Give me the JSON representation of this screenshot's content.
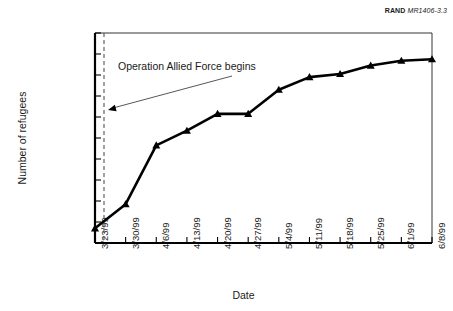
{
  "credit": {
    "brand": "RAND",
    "document": "MR1406-3.3"
  },
  "chart_data": {
    "type": "line",
    "title": "",
    "xlabel": "Date",
    "ylabel": "Number of refugees",
    "categories": [
      "3/23/99",
      "3/30/99",
      "4/6/99",
      "4/13/99",
      "4/20/99",
      "4/27/99",
      "5/4/99",
      "5/11/99",
      "5/18/99",
      "5/25/99",
      "6/1/99",
      "6/8/99"
    ],
    "values": [
      70000,
      185000,
      465000,
      535000,
      615000,
      615000,
      730000,
      790000,
      805000,
      845000,
      868000,
      875000
    ],
    "ylim": [
      0,
      1000000
    ],
    "ytick_values": [
      0,
      100000,
      200000,
      300000,
      400000,
      500000,
      600000,
      700000,
      800000,
      900000,
      1000000
    ],
    "ytick_labels": [
      "0",
      "100,000",
      "200,000",
      "300,000",
      "400,000",
      "500,000",
      "600,000",
      "700,000",
      "800,000",
      "900,000",
      "1,000,000"
    ],
    "grid": false,
    "legend": false,
    "marker": "triangle",
    "line_color": "#000000",
    "annotations": [
      {
        "text": "Operation Allied Force begins",
        "event_x": "3/24/99",
        "points_to_value": 70000
      }
    ],
    "reference_line": {
      "label": "Operation Allied Force begins",
      "style": "dashed",
      "x_between": [
        "3/23/99",
        "3/30/99"
      ]
    }
  }
}
